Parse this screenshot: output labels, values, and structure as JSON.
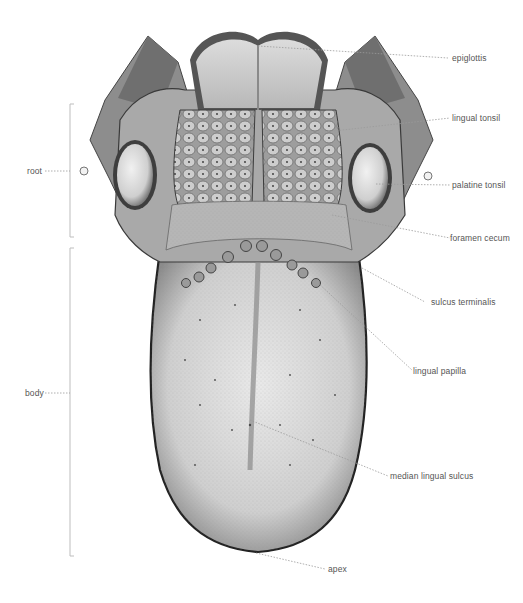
{
  "diagram": {
    "regions": [
      {
        "id": "root",
        "label": "root"
      },
      {
        "id": "body",
        "label": "body"
      }
    ],
    "labels": [
      {
        "id": "epiglottis",
        "label": "epiglottis"
      },
      {
        "id": "lingual-tonsil",
        "label": "lingual tonsil"
      },
      {
        "id": "palatine-tonsil",
        "label": "palatine tonsil"
      },
      {
        "id": "foramen-cecum",
        "label": "foramen cecum"
      },
      {
        "id": "sulcus-terminalis",
        "label": "sulcus terminalis"
      },
      {
        "id": "lingual-papilla",
        "label": "lingual papilla"
      },
      {
        "id": "median-lingual-sulcus",
        "label": "median lingual sulcus"
      },
      {
        "id": "apex",
        "label": "apex"
      }
    ],
    "colors": {
      "label_text": "#555555",
      "leader_line": "#9a9a9a",
      "bracket": "#bdbdbd"
    }
  }
}
